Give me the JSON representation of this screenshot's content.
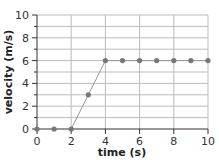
{
  "chart_data": {
    "type": "line",
    "title": "",
    "xlabel": "time (s)",
    "ylabel": "velocity (m/s)",
    "x": [
      0,
      1,
      2,
      3,
      4,
      5,
      6,
      7,
      8,
      9,
      10
    ],
    "series": [
      {
        "name": "velocity",
        "values": [
          0,
          0,
          0,
          3,
          6,
          6,
          6,
          6,
          6,
          6,
          6
        ]
      }
    ],
    "xlim": [
      0,
      10
    ],
    "ylim": [
      0,
      10
    ],
    "xticks": [
      "0",
      "2",
      "4",
      "6",
      "8",
      "10"
    ],
    "yticks": [
      "0",
      "2",
      "4",
      "6",
      "8",
      "10"
    ],
    "grid": true,
    "legend": null,
    "colors": {
      "line": "#999999",
      "marker": "#777777",
      "grid": "#bbbbbb",
      "axis": "#333333"
    }
  }
}
